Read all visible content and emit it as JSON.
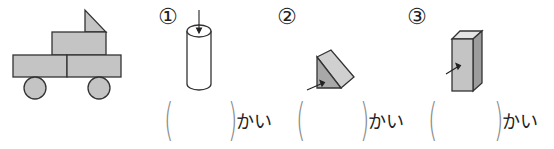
{
  "figure": {
    "name": "truck made of solid faces",
    "fill_color": "#c4c4c4",
    "stroke_color": "#333333"
  },
  "questions": [
    {
      "number": "①",
      "shape": "cylinder",
      "arrow_target": "top circular face",
      "answer": "",
      "unit": "かい"
    },
    {
      "number": "②",
      "shape": "triangular-prism",
      "arrow_target": "triangular face",
      "answer": "",
      "unit": "かい"
    },
    {
      "number": "③",
      "shape": "rectangular-prism",
      "arrow_target": "front rectangular face",
      "answer": "",
      "unit": "かい"
    }
  ],
  "paren_open": "(",
  "paren_close": ")"
}
